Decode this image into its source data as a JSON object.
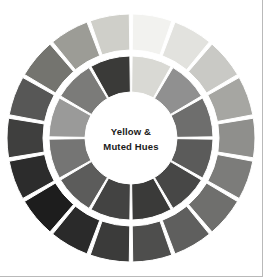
{
  "figure": {
    "title": "Yellow & Muted Hues",
    "center_label_line1": "Yellow &",
    "center_label_line2": "Muted Hues",
    "background_color": "#ffffff",
    "separator_color": "#ffffff",
    "edge_rule_color": "#b9b9b9"
  },
  "chart_data": {
    "type": "pie",
    "title": "Yellow & Muted Hues",
    "subtitle": "",
    "xlabel": "",
    "ylabel": "",
    "legend_position": "none",
    "grid": false,
    "geometry": {
      "center_x": 131,
      "center_y": 138,
      "outer_ring_outer_radius": 124,
      "outer_ring_inner_radius": 88,
      "inner_ring_outer_radius": 82,
      "inner_ring_inner_radius": 46,
      "center_disc_radius": 44,
      "outer_segment_count": 18,
      "inner_segment_count": 12,
      "segment_gap_degrees": 1.6,
      "start_angle_degrees": -90
    },
    "series": [
      {
        "name": "Outer ring",
        "segment_count": 18,
        "categories": [
          "O1",
          "O2",
          "O3",
          "O4",
          "O5",
          "O6",
          "O7",
          "O8",
          "O9",
          "O10",
          "O11",
          "O12",
          "O13",
          "O14",
          "O15",
          "O16",
          "O17",
          "O18"
        ],
        "values": [
          1,
          1,
          1,
          1,
          1,
          1,
          1,
          1,
          1,
          1,
          1,
          1,
          1,
          1,
          1,
          1,
          1,
          1
        ],
        "colors": [
          "#f2f2ef",
          "#e2e2de",
          "#c9c9c5",
          "#a6a6a2",
          "#8f8f8c",
          "#7c7c7a",
          "#6f6f6d",
          "#5f5f5e",
          "#4e4e4d",
          "#3b3b3a",
          "#2a2a2a",
          "#1d1d1d",
          "#2c2c2c",
          "#3f3f3e",
          "#575756",
          "#74746f",
          "#9c9c96",
          "#cfcfc9"
        ]
      },
      {
        "name": "Inner ring",
        "segment_count": 12,
        "categories": [
          "I1",
          "I2",
          "I3",
          "I4",
          "I5",
          "I6",
          "I7",
          "I8",
          "I9",
          "I10",
          "I11",
          "I12"
        ],
        "values": [
          1,
          1,
          1,
          1,
          1,
          1,
          1,
          1,
          1,
          1,
          1,
          1
        ],
        "colors": [
          "#d9d9d4",
          "#909090",
          "#6e6e6d",
          "#5b5b5a",
          "#474746",
          "#3a3a39",
          "#434342",
          "#5c5c5b",
          "#757574",
          "#9a9a99",
          "#7b7b79",
          "#3a3a38"
        ]
      }
    ]
  }
}
